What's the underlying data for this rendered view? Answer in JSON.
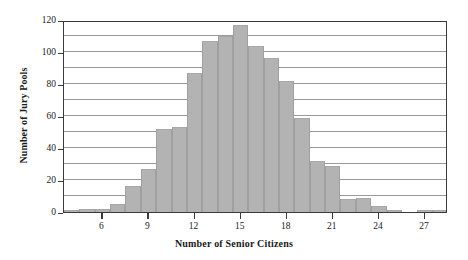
{
  "chart_data": {
    "type": "bar",
    "title": "",
    "xlabel": "Number of Senior Citizens",
    "ylabel": "Number of Jury Pools",
    "categories": [
      4,
      5,
      6,
      7,
      8,
      9,
      10,
      11,
      12,
      13,
      14,
      15,
      16,
      17,
      18,
      19,
      20,
      21,
      22,
      23,
      24,
      25,
      26,
      27,
      28
    ],
    "values": [
      1,
      2,
      2,
      5,
      16,
      27,
      52,
      53,
      87,
      107,
      110,
      117,
      104,
      96,
      82,
      59,
      32,
      29,
      8,
      9,
      4,
      1,
      0,
      1,
      1
    ],
    "xlim": [
      4,
      29
    ],
    "ylim": [
      0,
      120
    ],
    "ytick_values": [
      0,
      20,
      40,
      60,
      80,
      100,
      120
    ],
    "ytick_labels": [
      "0",
      "20",
      "40",
      "60",
      "80",
      "100",
      "120"
    ],
    "ygrid_values": [
      10,
      20,
      30,
      40,
      50,
      60,
      70,
      80,
      90,
      100,
      110
    ],
    "xtick_values": [
      6,
      9,
      12,
      15,
      18,
      21,
      24,
      27
    ],
    "xtick_labels": [
      "6",
      "9",
      "12",
      "15",
      "18",
      "21",
      "24",
      "27"
    ],
    "grid": true,
    "legend": false,
    "bar_color": "#b3b3b3",
    "axis_color": "#3a3a3a",
    "grid_color": "#9a9a9a"
  }
}
